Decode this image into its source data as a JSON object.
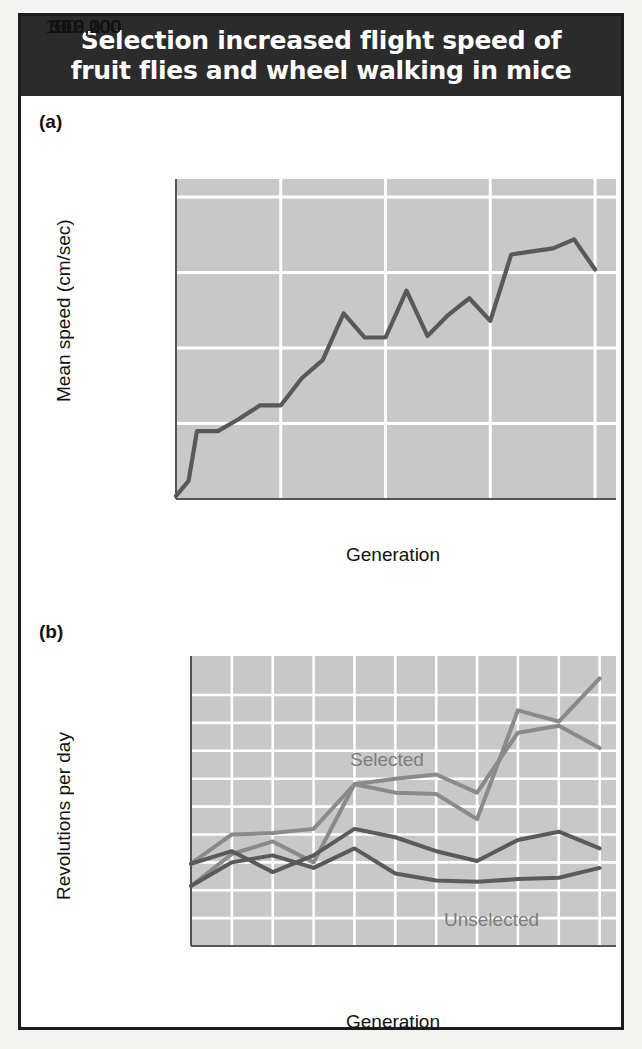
{
  "figure": {
    "title": "Selection increased flight speed of fruit flies and wheel walking in mice",
    "panel_a_tag": "(a)",
    "panel_b_tag": "(b)",
    "frame_color": "#1c1c1c",
    "title_bg": "#2b2b2b",
    "title_fg": "#ffffff",
    "plot_bg": "#c8c8c8",
    "grid_color": "#ffffff"
  },
  "chart_data": [
    {
      "type": "line",
      "panel": "(a)",
      "title": "",
      "xlabel": "Generation",
      "ylabel": "Mean speed (cm/sec)",
      "xlim": [
        0,
        105
      ],
      "ylim": [
        0,
        212
      ],
      "xticks": [
        0,
        50,
        100
      ],
      "xtick_labels": [
        "0",
        "50",
        "100"
      ],
      "yticks": [
        0,
        100,
        200
      ],
      "ytick_labels": [
        "0",
        "100",
        "200"
      ],
      "x_minor_gridlines": [
        25,
        50,
        75,
        100
      ],
      "y_minor_gridlines": [
        50,
        100,
        150,
        200
      ],
      "grid": true,
      "legend": "none",
      "line_color": "#595959",
      "series": [
        {
          "name": "Mean flight speed",
          "x": [
            0,
            3,
            5,
            10,
            15,
            20,
            25,
            30,
            35,
            40,
            45,
            50,
            55,
            60,
            65,
            70,
            75,
            80,
            85,
            90,
            95,
            100
          ],
          "values": [
            2,
            12,
            45,
            45,
            53,
            62,
            62,
            80,
            92,
            123,
            107,
            107,
            138,
            108,
            122,
            133,
            118,
            162,
            164,
            166,
            172,
            152
          ]
        }
      ]
    },
    {
      "type": "line",
      "panel": "(b)",
      "title": "",
      "xlabel": "Generation",
      "ylabel": "Revolutions per day",
      "xlim": [
        0,
        10.4
      ],
      "ylim": [
        2000,
        12400
      ],
      "xticks": [
        0,
        5,
        10
      ],
      "xtick_labels": [
        "0",
        "5",
        "10"
      ],
      "yticks": [
        2000,
        6000,
        10000
      ],
      "ytick_labels": [
        "2,000",
        "6,000",
        "10,000"
      ],
      "x_minor_gridlines": [
        0,
        1,
        2,
        3,
        4,
        5,
        6,
        7,
        8,
        9,
        10
      ],
      "y_minor_gridlines": [
        3000,
        4000,
        5000,
        6000,
        7000,
        8000,
        9000,
        10000,
        11000
      ],
      "grid": true,
      "legend": "inline-annotations",
      "annotations": [
        {
          "text": "Selected",
          "x": 3.3,
          "y": 8700,
          "color": "#8a8a8a"
        },
        {
          "text": "Unselected",
          "x": 6.4,
          "y": 3250,
          "color": "#6e6e6e"
        }
      ],
      "selected_color": "#8a8a8a",
      "unselected_color": "#5a5a5a",
      "series": [
        {
          "name": "Selected line 1",
          "group": "Selected",
          "color": "#8a8a8a",
          "x": [
            0,
            1,
            2,
            3,
            4,
            5,
            6,
            7,
            8,
            9,
            10
          ],
          "values": [
            4950,
            6000,
            6050,
            6200,
            7800,
            7500,
            7450,
            6550,
            10450,
            10050,
            11600
          ]
        },
        {
          "name": "Selected line 2",
          "group": "Selected",
          "color": "#8a8a8a",
          "x": [
            0,
            1,
            2,
            3,
            4,
            5,
            6,
            7,
            8,
            9,
            10
          ],
          "values": [
            4150,
            5300,
            5750,
            5000,
            7800,
            8000,
            8150,
            7500,
            9650,
            9900,
            9100
          ]
        },
        {
          "name": "Unselected line 1",
          "group": "Unselected",
          "color": "#5a5a5a",
          "x": [
            0,
            1,
            2,
            3,
            4,
            5,
            6,
            7,
            8,
            9,
            10
          ],
          "values": [
            4950,
            5400,
            4650,
            5250,
            6200,
            5900,
            5400,
            5050,
            5800,
            6100,
            5500
          ]
        },
        {
          "name": "Unselected line 2",
          "group": "Unselected",
          "color": "#5a5a5a",
          "x": [
            0,
            1,
            2,
            3,
            4,
            5,
            6,
            7,
            8,
            9,
            10
          ],
          "values": [
            4150,
            5000,
            5250,
            4800,
            5500,
            4600,
            4350,
            4300,
            4400,
            4450,
            4800
          ]
        }
      ]
    }
  ]
}
